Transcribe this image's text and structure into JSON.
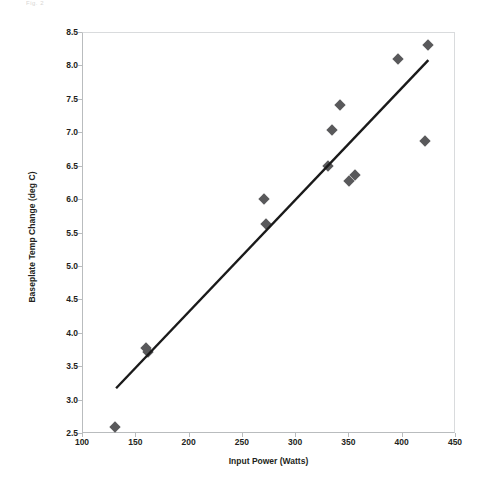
{
  "figure": {
    "top_artifact_text": "Fig. 2",
    "marker_color": "#59595b",
    "trendline_color": "#1a1a1a",
    "grid_color": "#e2e4e6",
    "axis_color": "#b9bcbe",
    "text_color": "#231f20"
  },
  "chart_data": {
    "type": "scatter",
    "title": "",
    "xlabel": "Input Power (Watts)",
    "ylabel": "Baseplate Temp Change (deg C)",
    "xlim": [
      100,
      450
    ],
    "ylim": [
      2.5,
      8.5
    ],
    "xticks": [
      100,
      150,
      200,
      250,
      300,
      350,
      400,
      450
    ],
    "yticks": [
      2.5,
      3.0,
      3.5,
      4.0,
      4.5,
      5.0,
      5.5,
      6.0,
      6.5,
      7.0,
      7.5,
      8.0,
      8.5
    ],
    "xtick_labels": [
      "100",
      "150",
      "200",
      "250",
      "300",
      "350",
      "400",
      "450"
    ],
    "ytick_labels": [
      "2.5",
      "3.0",
      "3.5",
      "4.0",
      "4.5",
      "5.0",
      "5.5",
      "6.0",
      "6.5",
      "7.0",
      "7.5",
      "8.0",
      "8.5"
    ],
    "grid": true,
    "legend": null,
    "marker_style": "diamond",
    "series": [
      {
        "name": "Measured data",
        "x": [
          130,
          159,
          161,
          270,
          272,
          330,
          334,
          341,
          350,
          355,
          396,
          421,
          424
        ],
        "y": [
          2.61,
          3.78,
          3.72,
          6.01,
          5.64,
          6.51,
          7.05,
          7.42,
          6.29,
          6.37,
          8.11,
          6.89,
          8.32
        ],
        "points": [
          {
            "x": 130,
            "y": 2.61
          },
          {
            "x": 159,
            "y": 3.78
          },
          {
            "x": 161,
            "y": 3.72
          },
          {
            "x": 270,
            "y": 6.01
          },
          {
            "x": 272,
            "y": 5.64
          },
          {
            "x": 330,
            "y": 6.51
          },
          {
            "x": 334,
            "y": 7.05
          },
          {
            "x": 341,
            "y": 7.42
          },
          {
            "x": 350,
            "y": 6.29
          },
          {
            "x": 355,
            "y": 6.37
          },
          {
            "x": 396,
            "y": 8.11
          },
          {
            "x": 421,
            "y": 6.89
          },
          {
            "x": 424,
            "y": 8.32
          }
        ]
      }
    ],
    "trendline": {
      "type": "linear",
      "x_start": 132,
      "y_start": 3.17,
      "x_end": 425,
      "y_end": 8.08
    }
  }
}
